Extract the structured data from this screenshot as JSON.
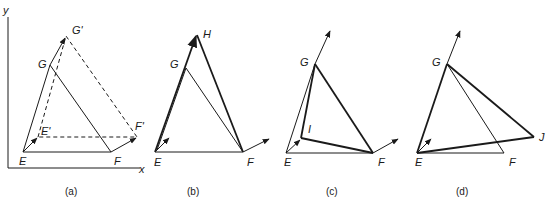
{
  "figure": {
    "axes": {
      "x_label": "x",
      "y_label": "y"
    },
    "panels": [
      {
        "id": "a",
        "caption": "(a)",
        "points": {
          "E": "E",
          "F": "F",
          "G": "G",
          "E_prime": "E'",
          "F_prime": "F'",
          "G_prime": "G'"
        },
        "description": "Triangle EGF translated to E'G'F' (dashed)"
      },
      {
        "id": "b",
        "caption": "(b)",
        "points": {
          "E": "E",
          "F": "F",
          "G": "G",
          "H": "H"
        },
        "description": "Triangle EHF with G moved along EG to H"
      },
      {
        "id": "c",
        "caption": "(c)",
        "points": {
          "E": "E",
          "F": "F",
          "G": "G",
          "I": "I"
        },
        "description": "Triangle IGF with E moved to I"
      },
      {
        "id": "d",
        "caption": "(d)",
        "points": {
          "E": "E",
          "F": "F",
          "G": "G",
          "J": "J"
        },
        "description": "Triangle EGJ with F moved to J"
      }
    ],
    "colors": {
      "ink": "#1a1a1a",
      "background": "#ffffff"
    }
  }
}
